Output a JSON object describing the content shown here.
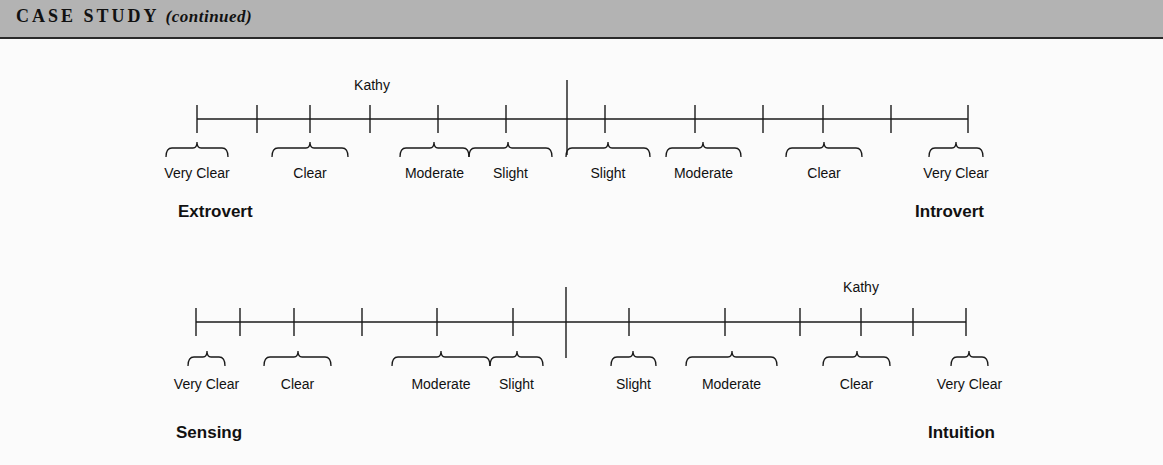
{
  "header": {
    "title": "CASE STUDY",
    "subtitle": "(continued)",
    "bg_color": "#b3b3b3"
  },
  "scales": [
    {
      "name": "extrovert-introvert",
      "left_pole": "Extrovert",
      "right_pole": "Introvert",
      "marker_label": "Kathy",
      "marker_position": "Clear (Extrovert side)",
      "line_y": 119,
      "line_x": [
        197,
        968
      ],
      "center_x": 567,
      "center_y": [
        80,
        155
      ],
      "ticks": [
        197,
        257,
        310,
        370,
        438,
        506,
        605,
        695,
        763,
        823,
        891,
        968
      ],
      "marker_x": 372,
      "marker_y": 90,
      "brace_y": 148,
      "label_y": 178,
      "pole_y": 217,
      "pole_left_x": 178,
      "pole_right_x": 984,
      "braces": [
        {
          "label": "Very Clear",
          "x1": 166,
          "x2": 228,
          "tip": 197
        },
        {
          "label": "Clear",
          "x1": 272,
          "x2": 348,
          "tip": 310
        },
        {
          "label": "Moderate",
          "x1": 400,
          "x2": 469,
          "tip": 434
        },
        {
          "label": "Slight",
          "x1": 469,
          "x2": 552,
          "tip": 508
        },
        {
          "label": "Slight",
          "x1": 566,
          "x2": 650,
          "tip": 608
        },
        {
          "label": "Moderate",
          "x1": 666,
          "x2": 741,
          "tip": 703
        },
        {
          "label": "Clear",
          "x1": 786,
          "x2": 862,
          "tip": 824
        },
        {
          "label": "Very Clear",
          "x1": 929,
          "x2": 983,
          "tip": 956
        }
      ]
    },
    {
      "name": "sensing-intuition",
      "left_pole": "Sensing",
      "right_pole": "Intuition",
      "marker_label": "Kathy",
      "marker_position": "Clear (Intuition side)",
      "line_y": 322,
      "line_x": [
        196,
        966
      ],
      "center_x": 566,
      "center_y": [
        287,
        358
      ],
      "ticks": [
        196,
        240,
        294,
        362,
        437,
        513,
        629,
        725,
        800,
        861,
        913,
        966
      ],
      "marker_x": 861,
      "marker_y": 292,
      "brace_y": 357,
      "label_y": 389,
      "pole_y": 438,
      "pole_left_x": 176,
      "pole_right_x": 995,
      "braces": [
        {
          "label": "Very Clear",
          "x1": 188,
          "x2": 225,
          "tip": 207
        },
        {
          "label": "Clear",
          "x1": 264,
          "x2": 331,
          "tip": 298
        },
        {
          "label": "Moderate",
          "x1": 392,
          "x2": 490,
          "tip": 441
        },
        {
          "label": "Slight",
          "x1": 490,
          "x2": 543,
          "tip": 517
        },
        {
          "label": "Slight",
          "x1": 611,
          "x2": 656,
          "tip": 633
        },
        {
          "label": "Moderate",
          "x1": 686,
          "x2": 777,
          "tip": 732
        },
        {
          "label": "Clear",
          "x1": 823,
          "x2": 890,
          "tip": 857
        },
        {
          "label": "Very Clear",
          "x1": 951,
          "x2": 988,
          "tip": 969
        }
      ]
    }
  ]
}
